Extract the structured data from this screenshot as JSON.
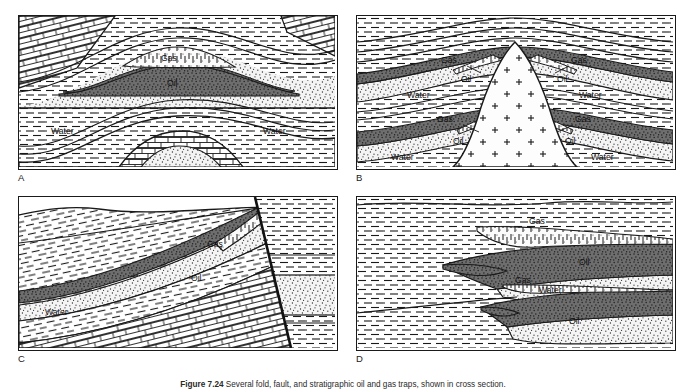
{
  "figure": {
    "caption_label": "Figure 7.24",
    "caption_text": "Several fold, fault, and stratigraphic oil and gas traps, shown in cross section.",
    "panel_letters": [
      "A",
      "B",
      "C",
      "D"
    ]
  },
  "legend_terms": {
    "gas": "Gas",
    "oil": "Oil",
    "water": "Water"
  },
  "colors": {
    "oil_fill": "#6e6e6e",
    "water_fill": "#f2f2f2",
    "gas_fill": "#fbfbfb",
    "intrusion_fill": "#fdfdfd",
    "stroke": "#1a1a1a",
    "background": "#ffffff"
  },
  "panels": [
    {
      "id": "A",
      "letter": "A",
      "trap_type": "anticline-trap",
      "labels": [
        {
          "text": "Gas",
          "x": 155,
          "y": 41
        },
        {
          "text": "Oil",
          "x": 157,
          "y": 66
        },
        {
          "text": "Water",
          "x": 45,
          "y": 113
        },
        {
          "text": "Water",
          "x": 258,
          "y": 113
        }
      ]
    },
    {
      "id": "B",
      "letter": "B",
      "trap_type": "salt-dome-intrusion-trap",
      "labels": [
        {
          "text": "Gas",
          "x": 100,
          "y": 47
        },
        {
          "text": "Gas",
          "x": 213,
          "y": 47
        },
        {
          "text": "Oil",
          "x": 113,
          "y": 70
        },
        {
          "text": "Oil",
          "x": 205,
          "y": 70
        },
        {
          "text": "Water",
          "x": 60,
          "y": 92
        },
        {
          "text": "Water",
          "x": 240,
          "y": 92
        },
        {
          "text": "Gas",
          "x": 96,
          "y": 110
        },
        {
          "text": "Gas",
          "x": 218,
          "y": 110
        },
        {
          "text": "Oil",
          "x": 103,
          "y": 134
        },
        {
          "text": "Oil",
          "x": 215,
          "y": 134
        },
        {
          "text": "Water",
          "x": 45,
          "y": 155
        },
        {
          "text": "Water",
          "x": 245,
          "y": 155
        }
      ]
    },
    {
      "id": "C",
      "letter": "C",
      "trap_type": "fault-trap",
      "labels": [
        {
          "text": "Gas",
          "x": 197,
          "y": 55
        },
        {
          "text": "Oil",
          "x": 180,
          "y": 88
        },
        {
          "text": "Water",
          "x": 38,
          "y": 117
        }
      ]
    },
    {
      "id": "D",
      "letter": "D",
      "trap_type": "stratigraphic-pinchout-trap",
      "labels": [
        {
          "text": "Gas",
          "x": 180,
          "y": 32
        },
        {
          "text": "Oil",
          "x": 228,
          "y": 68
        },
        {
          "text": "Water",
          "x": 190,
          "y": 98
        },
        {
          "text": "Gas",
          "x": 165,
          "y": 128
        },
        {
          "text": "Oil",
          "x": 215,
          "y": 163
        }
      ]
    }
  ]
}
